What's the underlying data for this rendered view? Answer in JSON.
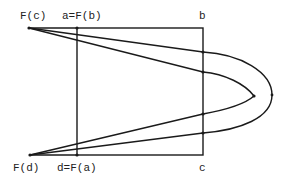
{
  "diagram": {
    "title": "",
    "labels": {
      "fc": "F(c)",
      "a": "a=F(b)",
      "b": "b",
      "fd": "F(d)",
      "d": "d=F(a)",
      "c": "c"
    },
    "colors": {
      "stroke": "#1a1a1a",
      "background": "#ffffff"
    }
  }
}
